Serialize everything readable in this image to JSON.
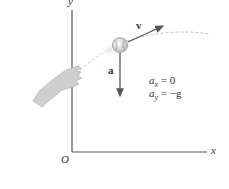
{
  "diagram": {
    "type": "projectile-motion",
    "axes": {
      "y_label": "y",
      "x_label": "x",
      "origin_label": "O"
    },
    "vectors": {
      "velocity_label": "v⃗",
      "acceleration_label": "a⃗"
    },
    "equations": {
      "ax_var": "a",
      "ax_sub": "x",
      "ax_rhs": "= 0",
      "ay_var": "a",
      "ay_sub": "y",
      "ay_rhs": "= −g"
    },
    "objects": [
      "hand-icon",
      "ball-icon",
      "trajectory"
    ],
    "colors": {
      "axis": "#555555",
      "vector": "#555555",
      "trajectory": "#bbbbbb",
      "hand": "#c8c8c8",
      "ball": "#e0e0e0"
    }
  }
}
